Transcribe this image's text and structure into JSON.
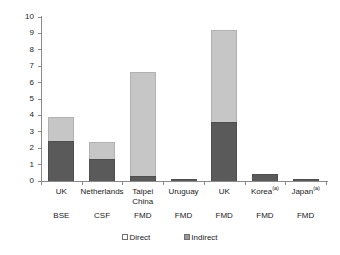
{
  "chart_data": {
    "type": "bar",
    "stacked": true,
    "title": "",
    "xlabel": "",
    "ylabel": "US$ billion",
    "ylim": [
      0,
      10
    ],
    "ytick_labels": [
      "10",
      "9",
      "8",
      "7",
      "6",
      "5",
      "4",
      "3",
      "2",
      "1",
      "0"
    ],
    "ytick_values": [
      10,
      9,
      8,
      7,
      6,
      5,
      4,
      3,
      2,
      1,
      0
    ],
    "grid": false,
    "legend_position": "bottom",
    "categories": [
      "UK",
      "Netherlands",
      "Taipei China",
      "Uruguay",
      "UK",
      "Korea",
      "Japan"
    ],
    "category_lines": [
      [
        "UK"
      ],
      [
        "Netherlands"
      ],
      [
        "Taipei",
        "China"
      ],
      [
        "Uruguay"
      ],
      [
        "UK"
      ],
      [
        "Korea"
      ],
      [
        "Japan"
      ]
    ],
    "category_footnotes": [
      "",
      "",
      "",
      "",
      "",
      "(a)",
      "(a)"
    ],
    "sub_categories": [
      "BSE",
      "CSF",
      "FMD",
      "FMD",
      "FMD",
      "FMD",
      "FMD"
    ],
    "series": [
      {
        "name": "Direct",
        "color": "#5a5a5a",
        "values": [
          2.45,
          1.35,
          0.3,
          0.15,
          3.6,
          0.45,
          0.1
        ]
      },
      {
        "name": "Indirect",
        "color": "#c6c6c6",
        "values": [
          1.45,
          1.0,
          6.35,
          0.0,
          5.6,
          0.0,
          0.0
        ]
      }
    ],
    "totals": [
      3.9,
      2.35,
      6.65,
      0.15,
      9.2,
      0.45,
      0.1
    ]
  },
  "legend": {
    "items": [
      {
        "label": "Direct",
        "swatch": "direct"
      },
      {
        "label": "Indirect",
        "swatch": "indirect"
      }
    ]
  }
}
